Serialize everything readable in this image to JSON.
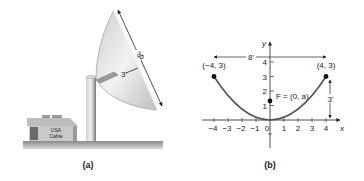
{
  "panel_a": {
    "caption": "(a)",
    "dish_width_label": "8'",
    "dish_depth_label": "3'",
    "building_sign_line1": "USA",
    "building_sign_line2": "Cable"
  },
  "panel_b": {
    "caption": "(b)",
    "x_axis_label": "x",
    "y_axis_label": "y",
    "x_ticks": [
      "−4",
      "−3",
      "−2",
      "−1",
      "0",
      "1",
      "2",
      "3",
      "4"
    ],
    "y_ticks": [
      "1",
      "2",
      "3",
      "4"
    ],
    "left_point_label": "(−4, 3)",
    "right_point_label": "(4, 3)",
    "focus_label": "F = (0, a)",
    "width_label": "8'",
    "height_label": "3'"
  },
  "colors": {
    "curve": "#555555",
    "axes": "#222222",
    "dish_light": "#e6e6e6",
    "dish_dark": "#9a9a9a",
    "ground": "#8f8f8f"
  }
}
